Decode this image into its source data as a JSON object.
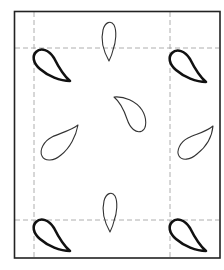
{
  "diagram": {
    "type": "paisley-tile-layout",
    "colors": {
      "background": "#ffffff",
      "frame": "#222222",
      "guide": "#9a9a9a",
      "bold_motif": "#111111",
      "thin_motif": "#333333"
    },
    "frame": {
      "x": 14,
      "y": 11,
      "width": 206,
      "height": 247
    },
    "guides": {
      "vertical_x": [
        34,
        170
      ],
      "horizontal_y": [
        48,
        220
      ]
    },
    "motifs": [
      {
        "id": "corner-top-left",
        "style": "bold"
      },
      {
        "id": "corner-top-right",
        "style": "bold"
      },
      {
        "id": "corner-bottom-left",
        "style": "bold"
      },
      {
        "id": "corner-bottom-right",
        "style": "bold"
      },
      {
        "id": "top-center",
        "style": "thin"
      },
      {
        "id": "center",
        "style": "thin"
      },
      {
        "id": "middle-left",
        "style": "thin"
      },
      {
        "id": "middle-right",
        "style": "thin"
      },
      {
        "id": "bottom-center",
        "style": "thin"
      }
    ]
  }
}
